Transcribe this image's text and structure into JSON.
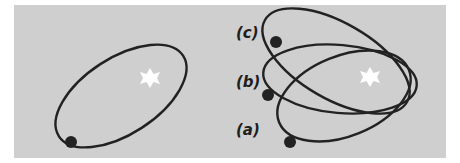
{
  "figure": {
    "background_color": "#cfcfcf",
    "orbit_color": "#222222",
    "star_color": "#ffffff",
    "planet_color": "#222222",
    "left_panel": {
      "description": "single elliptical orbit with star at one focus and planet near periapsis/apoapsis"
    },
    "right_panel": {
      "labels": [
        "(c)",
        "(b)",
        "(a)"
      ]
    }
  }
}
